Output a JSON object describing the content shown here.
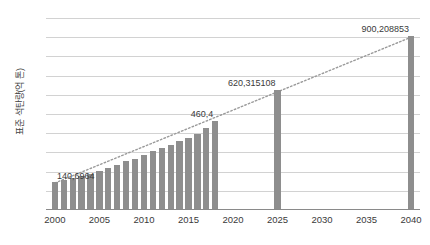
{
  "chart_data": {
    "type": "bar",
    "title": "",
    "xlabel": "",
    "ylabel": "표준 석탄량(억 톤)",
    "ylim": [
      0,
      1000
    ],
    "ytick_labels": [
      "0",
      "100",
      "200",
      "300",
      "400",
      "500",
      "600",
      "700",
      "800",
      "900",
      "1,000"
    ],
    "ytick_values": [
      0,
      100,
      200,
      300,
      400,
      500,
      600,
      700,
      800,
      900,
      1000
    ],
    "xtick_labels": [
      "2000",
      "2005",
      "2010",
      "2015",
      "2020",
      "2025",
      "2030",
      "2035",
      "2040"
    ],
    "xtick_values": [
      2000,
      2005,
      2010,
      2015,
      2020,
      2025,
      2030,
      2035,
      2040
    ],
    "xlim": [
      1999,
      2041
    ],
    "grid": "horizontal",
    "legend": "none",
    "bar_color": "#8e8e8e",
    "gridline_color": "#d2d2d2",
    "series": [
      {
        "name": "표준 석탄량",
        "x": [
          2000,
          2001,
          2002,
          2003,
          2004,
          2005,
          2006,
          2007,
          2008,
          2009,
          2010,
          2011,
          2012,
          2013,
          2014,
          2015,
          2016,
          2017,
          2018,
          2025,
          2040
        ],
        "values": [
          140.6964,
          152,
          162,
          172,
          185,
          200,
          215,
          232,
          248,
          262,
          282,
          300,
          318,
          335,
          352,
          372,
          392,
          420,
          460.4,
          620.315108,
          900.208853
        ]
      }
    ],
    "annotations": [
      {
        "label": "140,6964",
        "x": 2000,
        "y": 140.6964
      },
      {
        "label": "460,4",
        "x": 2018,
        "y": 460.4
      },
      {
        "label": "620,315108",
        "x": 2025,
        "y": 620.315108
      },
      {
        "label": "900,208853",
        "x": 2040,
        "y": 900.208853
      }
    ],
    "trendline": {
      "style": "dotted",
      "color": "#9a9a9a",
      "from": {
        "x": 2000,
        "y": 140.6964
      },
      "to": {
        "x": 2040,
        "y": 900.208853
      }
    }
  }
}
